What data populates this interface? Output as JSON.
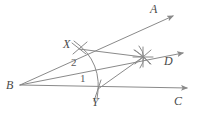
{
  "figure": {
    "background_color": "#ffffff",
    "line_color": "#8a8a8a",
    "label_color": "#4a4a4a",
    "width": 203,
    "height": 122
  },
  "points": {
    "vertex": {
      "label": "B",
      "x": 20,
      "y": 85,
      "text_x": 6,
      "text_y": 79
    },
    "ray_a_tip": {
      "label": "A",
      "x": 176,
      "y": 14,
      "text_x": 150,
      "text_y": 3
    },
    "ray_d_tip": {
      "label": "D",
      "x": 186,
      "y": 52,
      "text_x": 164,
      "text_y": 55
    },
    "ray_c_tip": {
      "label": "C",
      "x": 190,
      "y": 89,
      "text_x": 174,
      "text_y": 95
    },
    "arc_point_x": {
      "label": "X",
      "x": 79,
      "y": 49,
      "text_x": 63,
      "text_y": 38
    },
    "arc_point_y": {
      "label": "Y",
      "x": 98,
      "y": 89,
      "text_x": 92,
      "text_y": 96
    },
    "intersection_star": {
      "label": "",
      "x": 143,
      "y": 57
    }
  },
  "angle_labels": [
    {
      "name": "angle-2",
      "label": "2",
      "text_x": 71,
      "text_y": 57
    },
    {
      "name": "angle-1",
      "label": "1",
      "text_x": 80,
      "text_y": 73
    }
  ],
  "rays": [
    {
      "name": "ray-BA",
      "from": "B",
      "to": "A"
    },
    {
      "name": "ray-BD",
      "from": "B",
      "to": "D"
    },
    {
      "name": "ray-BC",
      "from": "B",
      "to": "C"
    }
  ],
  "segments": [
    {
      "name": "segment-X-star",
      "from": "X",
      "to": "star"
    },
    {
      "name": "segment-Y-star",
      "from": "Y",
      "to": "star"
    }
  ],
  "arcs": [
    {
      "name": "arc-XY-centered-B",
      "center": "B",
      "through": "X and Y"
    },
    {
      "name": "arc-from-X",
      "center": "X",
      "near": "star"
    },
    {
      "name": "arc-from-Y",
      "center": "Y",
      "near": "star"
    }
  ]
}
